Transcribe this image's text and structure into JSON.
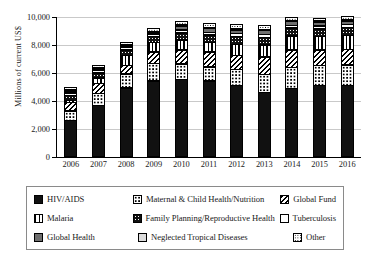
{
  "chart_data": {
    "type": "bar",
    "subtype": "stacked-bar",
    "title": "",
    "xlabel": "",
    "ylabel": "Millions of current US$",
    "ylim": [
      0,
      10000
    ],
    "ytick_labels": [
      "0",
      "2,000",
      "4,000",
      "6,000",
      "8,000",
      "10,000"
    ],
    "yticks": [
      0,
      2000,
      4000,
      6000,
      8000,
      10000
    ],
    "grid": true,
    "legend_position": "bottom",
    "categories": [
      "2006",
      "2007",
      "2008",
      "2009",
      "2010",
      "2011",
      "2012",
      "2013",
      "2014",
      "2015",
      "2016"
    ],
    "series": [
      {
        "name": "HIV/AIDS",
        "pattern": "solid-black",
        "values": [
          2650,
          3700,
          4950,
          5450,
          5550,
          5450,
          5150,
          4650,
          4900,
          5150,
          5150
        ]
      },
      {
        "name": "Maternal & Child Health/Nutrition",
        "pattern": "white-dots",
        "values": [
          700,
          900,
          1050,
          1300,
          1150,
          1050,
          1150,
          1300,
          1550,
          1450,
          1500
        ]
      },
      {
        "name": "Global Fund",
        "pattern": "diagonal-hatch",
        "values": [
          650,
          750,
          650,
          850,
          1050,
          1100,
          1050,
          1300,
          1300,
          1150,
          1150
        ]
      },
      {
        "name": "Malaria",
        "pattern": "vertical-hatch",
        "values": [
          200,
          450,
          750,
          750,
          750,
          750,
          850,
          900,
          1050,
          1000,
          1050
        ]
      },
      {
        "name": "Family Planning/Reproductive Health",
        "pattern": "black-white-dots",
        "values": [
          400,
          400,
          450,
          450,
          550,
          550,
          600,
          600,
          600,
          600,
          600
        ]
      },
      {
        "name": "Tuberculosis",
        "pattern": "white-empty",
        "values": [
          200,
          200,
          200,
          200,
          250,
          250,
          250,
          250,
          250,
          250,
          250
        ]
      },
      {
        "name": "Global Health",
        "pattern": "solid-gray",
        "values": [
          150,
          100,
          100,
          100,
          300,
          300,
          300,
          300,
          300,
          300,
          300
        ]
      },
      {
        "name": "Neglected Tropical Diseases",
        "pattern": "light-gray",
        "values": [
          50,
          50,
          50,
          50,
          100,
          100,
          100,
          100,
          100,
          100,
          100
        ]
      },
      {
        "name": "Other",
        "pattern": "fine-dots",
        "values": [
          250,
          250,
          250,
          250,
          350,
          350,
          350,
          300,
          250,
          250,
          250
        ]
      }
    ],
    "totals": [
      5250,
      6800,
      8450,
      9400,
      10050,
      9900,
      9800,
      9700,
      10300,
      10250,
      10350
    ]
  },
  "chart": {
    "ylabel": "Millions of current US$",
    "yticks": [
      "10,000",
      "8,000",
      "6,000",
      "4,000",
      "2,000",
      "0"
    ],
    "xlabels": [
      "2006",
      "2007",
      "2008",
      "2009",
      "2010",
      "2011",
      "2012",
      "2013",
      "2014",
      "2015",
      "2016"
    ]
  },
  "legend": {
    "rows": [
      {
        "c1": {
          "label": "HIV/AIDS",
          "swatch": "swatch-solid-black"
        },
        "c2": {
          "label": "Maternal & Child Health/Nutrition",
          "swatch": "swatch-white-dots"
        },
        "c3": {
          "label": "Global Fund",
          "swatch": "swatch-diagonal-hatch"
        }
      },
      {
        "c1": {
          "label": "Malaria",
          "swatch": "swatch-vertical-hatch"
        },
        "c2": {
          "label": "Family Planning/Reproductive Health",
          "swatch": "swatch-black-white-dots"
        },
        "c3": {
          "label": "Tuberculosis",
          "swatch": "swatch-white-empty"
        }
      },
      {
        "c1": {
          "label": "Global Health",
          "swatch": "swatch-solid-gray"
        },
        "c2": {
          "label": "Neglected Tropical Diseases",
          "swatch": "swatch-light-gray"
        },
        "c3": {
          "label": "Other",
          "swatch": "swatch-fine-dots"
        }
      }
    ]
  }
}
